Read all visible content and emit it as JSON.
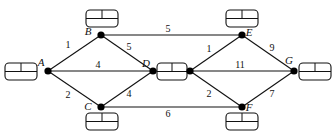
{
  "diagram": {
    "type": "weighted-network-graph",
    "nodes": [
      {
        "id": "A",
        "label": "A",
        "x": 48,
        "y": 71,
        "lx": 41,
        "ly": 66,
        "box": {
          "x": 5,
          "y": 63,
          "w": 32,
          "h": 17
        }
      },
      {
        "id": "B",
        "label": "B",
        "x": 101,
        "y": 35,
        "lx": 88,
        "ly": 35,
        "box": {
          "x": 86,
          "y": 10,
          "w": 32,
          "h": 17
        }
      },
      {
        "id": "C",
        "label": "C",
        "x": 101,
        "y": 107,
        "lx": 88,
        "ly": 110,
        "box": {
          "x": 86,
          "y": 113,
          "w": 32,
          "h": 17
        }
      },
      {
        "id": "D",
        "label": "D",
        "x": 153,
        "y": 71,
        "lx": 146,
        "ly": 67,
        "box": {
          "x": 157,
          "y": 63,
          "w": 30,
          "h": 17
        }
      },
      {
        "id": "D2",
        "label": "",
        "x": 190,
        "y": 71,
        "lx": 0,
        "ly": 0,
        "box": null
      },
      {
        "id": "E",
        "label": "E",
        "x": 242,
        "y": 35,
        "lx": 249,
        "ly": 36,
        "box": {
          "x": 226,
          "y": 10,
          "w": 32,
          "h": 17
        }
      },
      {
        "id": "F",
        "label": "F",
        "x": 242,
        "y": 107,
        "lx": 249,
        "ly": 111,
        "box": {
          "x": 226,
          "y": 113,
          "w": 32,
          "h": 17
        }
      },
      {
        "id": "G",
        "label": "G",
        "x": 294,
        "y": 71,
        "lx": 289,
        "ly": 64,
        "box": {
          "x": 299,
          "y": 63,
          "w": 32,
          "h": 17
        }
      }
    ],
    "edges": [
      {
        "from": "A",
        "to": "B",
        "weight": "1",
        "lx": 68,
        "ly": 48
      },
      {
        "from": "A",
        "to": "D",
        "weight": "4",
        "lx": 98,
        "ly": 68
      },
      {
        "from": "A",
        "to": "C",
        "weight": "2",
        "lx": 68,
        "ly": 98
      },
      {
        "from": "B",
        "to": "D",
        "weight": "5",
        "lx": 129,
        "ly": 50
      },
      {
        "from": "C",
        "to": "D",
        "weight": "4",
        "lx": 129,
        "ly": 97
      },
      {
        "from": "B",
        "to": "E",
        "weight": "5",
        "lx": 168,
        "ly": 32
      },
      {
        "from": "C",
        "to": "F",
        "weight": "6",
        "lx": 168,
        "ly": 117
      },
      {
        "from": "D2",
        "to": "E",
        "weight": "1",
        "lx": 209,
        "ly": 52
      },
      {
        "from": "D2",
        "to": "G",
        "weight": "11",
        "lx": 240,
        "ly": 68
      },
      {
        "from": "D2",
        "to": "F",
        "weight": "2",
        "lx": 209,
        "ly": 97
      },
      {
        "from": "E",
        "to": "G",
        "weight": "9",
        "lx": 272,
        "ly": 51
      },
      {
        "from": "F",
        "to": "G",
        "weight": "7",
        "lx": 272,
        "ly": 97
      }
    ]
  }
}
